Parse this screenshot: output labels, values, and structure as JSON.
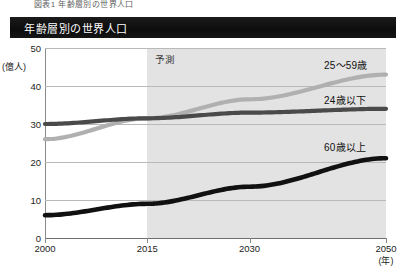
{
  "caption": "図表1 年齢層別の世界人口",
  "title": "年齢層別の世界人口",
  "forecast_label": "予測",
  "axis": {
    "y_unit": "(億人)",
    "x_unit": "(年)",
    "y_ticks": [
      "50",
      "40",
      "30",
      "20",
      "10",
      "0"
    ],
    "x_ticks": [
      "2000",
      "2015",
      "2030",
      "2050"
    ]
  },
  "series_labels": {
    "s25_59": "25〜59歳",
    "s24_under": "24歳以下",
    "s60_over": "60歳以上"
  },
  "colors": {
    "light_gray": "#b0b0b0",
    "dark_gray": "#4a4a4a",
    "black": "#111111",
    "band": "#e3e3e3",
    "title_bar": "#101010"
  },
  "chart_data": {
    "type": "line",
    "title": "年齢層別の世界人口",
    "xlabel": "(年)",
    "ylabel": "(億人)",
    "xlim": [
      2000,
      2050
    ],
    "ylim": [
      0,
      50
    ],
    "grid": true,
    "legend": "inline-right",
    "annotations": [
      {
        "text": "予測",
        "x": 2015,
        "note": "forecast shading begins at 2015"
      }
    ],
    "x": [
      2000,
      2015,
      2030,
      2050
    ],
    "series": [
      {
        "name": "25〜59歳",
        "color": "#b0b0b0",
        "values": [
          26.0,
          31.5,
          36.5,
          43.0
        ]
      },
      {
        "name": "24歳以下",
        "color": "#4a4a4a",
        "values": [
          30.0,
          31.5,
          33.0,
          34.0
        ]
      },
      {
        "name": "60歳以上",
        "color": "#111111",
        "values": [
          6.0,
          9.0,
          13.5,
          21.0
        ]
      }
    ]
  }
}
